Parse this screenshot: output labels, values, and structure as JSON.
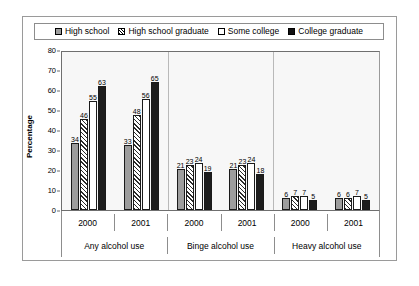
{
  "chart_data": {
    "type": "bar",
    "title": "",
    "xlabel": "",
    "ylabel": "Percentage",
    "ylim": [
      0,
      80
    ],
    "yticks": [
      0,
      10,
      20,
      30,
      40,
      50,
      60,
      70,
      80
    ],
    "grid": false,
    "legend_position": "top",
    "categories": [
      "Any alcohol use 2000",
      "Any alcohol use 2001",
      "Binge alcohol use 2000",
      "Binge alcohol use 2001",
      "Heavy alcohol use 2000",
      "Heavy alcohol use 2001"
    ],
    "group_labels": [
      "Any alcohol use",
      "Binge alcohol use",
      "Heavy alcohol use"
    ],
    "year_labels": [
      "2000",
      "2001",
      "2000",
      "2001",
      "2000",
      "2001"
    ],
    "series": [
      {
        "name": "High school",
        "fill": "gray",
        "values": [
          34,
          33,
          21,
          21,
          6,
          6
        ]
      },
      {
        "name": "High school graduate",
        "fill": "hatched",
        "values": [
          46,
          48,
          23,
          23,
          7,
          6
        ]
      },
      {
        "name": "Some college",
        "fill": "white",
        "values": [
          55,
          56,
          24,
          24,
          7,
          7
        ]
      },
      {
        "name": "College graduate",
        "fill": "black",
        "values": [
          63,
          65,
          19,
          18,
          5,
          5
        ]
      }
    ]
  },
  "legend": {
    "items": [
      {
        "label": "High school"
      },
      {
        "label": "High school graduate"
      },
      {
        "label": "Some college"
      },
      {
        "label": "College graduate"
      }
    ]
  },
  "colors": {
    "series_1": "#9d9d9d",
    "series_3": "#ffffff",
    "series_4": "#1d1d1d",
    "plot_background": "#f7f7f7",
    "axis": "#6f6f6f",
    "border": "#9a9a9a"
  }
}
